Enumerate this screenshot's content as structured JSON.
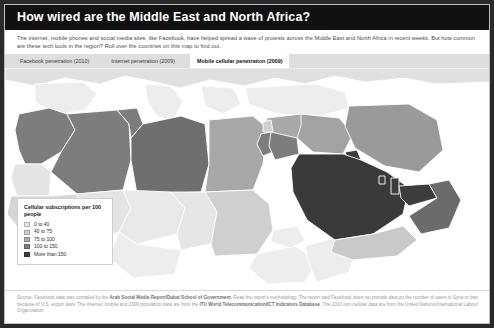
{
  "header": {
    "title": "How wired are the Middle East and North Africa?"
  },
  "deck": {
    "text": "The internet, mobile phones and social media sites, like Facebook, have helped spread a wave of protests across the Middle East and North Africa in recent weeks. But how common are these tech tools in the region? Roll over the countries on this map to find out."
  },
  "tabs": [
    {
      "label": "Facebook penetration (2010)",
      "active": false
    },
    {
      "label": "Internet penetration (2009)",
      "active": false
    },
    {
      "label": "Mobile cellular penetration (2009)",
      "active": true
    }
  ],
  "legend": {
    "title": "Cellular subscriptions per 100 people",
    "items": [
      {
        "label": "0 to 40",
        "color": "#e4e4e4"
      },
      {
        "label": "40 to 75",
        "color": "#cfcfcf"
      },
      {
        "label": "75 to 100",
        "color": "#ababab"
      },
      {
        "label": "100 to 150",
        "color": "#7d7d7d"
      },
      {
        "label": "More than 150",
        "color": "#3d3d3d"
      }
    ]
  },
  "footer": {
    "source_prefix": "Source: Facebook data was compiled by the ",
    "source_bold1": "Arab Social Media Report/Dubai School of Government",
    "source_mid": ". Read the report's methodology. The report said Facebook does not provide data on the number of users in Syria or Iran because of U.S. export laws. The internet, mobile and 2009 population data are from the ",
    "source_bold2": "ITU World Telecommunication/ICT Indicators Database",
    "source_suffix": ". The 2010 non-cellular data are from the United Nations/International Labour Organization."
  },
  "map": {
    "ocean_color": "#ffffff",
    "border_color": "#ffffff",
    "no_data_color": "#ededed",
    "countries": [
      {
        "name": "morocco",
        "bucket": 3,
        "color": "#7d7d7d"
      },
      {
        "name": "western-sahara",
        "bucket": 0,
        "color": "#e4e4e4"
      },
      {
        "name": "algeria",
        "bucket": 3,
        "color": "#7d7d7d"
      },
      {
        "name": "tunisia",
        "bucket": 3,
        "color": "#7d7d7d"
      },
      {
        "name": "libya",
        "bucket": 3,
        "color": "#6f6f6f"
      },
      {
        "name": "egypt",
        "bucket": 2,
        "color": "#a8a8a8"
      },
      {
        "name": "sudan",
        "bucket": 1,
        "color": "#cfcfcf"
      },
      {
        "name": "mauritania",
        "bucket": 1,
        "color": "#d6d6d6"
      },
      {
        "name": "mali",
        "bucket": 0,
        "color": "#e4e4e4"
      },
      {
        "name": "niger",
        "bucket": 0,
        "color": "#e9e9e9"
      },
      {
        "name": "chad",
        "bucket": 0,
        "color": "#e6e6e6"
      },
      {
        "name": "saudi-arabia",
        "bucket": 4,
        "color": "#3a3a3a"
      },
      {
        "name": "yemen",
        "bucket": 1,
        "color": "#c9c9c9"
      },
      {
        "name": "oman",
        "bucket": 3,
        "color": "#6b6b6b"
      },
      {
        "name": "uae",
        "bucket": 4,
        "color": "#3d3d3d"
      },
      {
        "name": "qatar",
        "bucket": 4,
        "color": "#3d3d3d"
      },
      {
        "name": "bahrain",
        "bucket": 4,
        "color": "#3d3d3d"
      },
      {
        "name": "kuwait",
        "bucket": 4,
        "color": "#3d3d3d"
      },
      {
        "name": "iraq",
        "bucket": 2,
        "color": "#a3a3a3"
      },
      {
        "name": "iran",
        "bucket": 2,
        "color": "#9a9a9a"
      },
      {
        "name": "jordan",
        "bucket": 3,
        "color": "#7d7d7d"
      },
      {
        "name": "syria",
        "bucket": 2,
        "color": "#a8a8a8"
      },
      {
        "name": "lebanon",
        "bucket": 1,
        "color": "#cfcfcf"
      },
      {
        "name": "israel",
        "bucket": 3,
        "color": "#7d7d7d"
      },
      {
        "name": "turkey",
        "bucket": 0,
        "color": "#ededed"
      },
      {
        "name": "ethiopia",
        "bucket": 0,
        "color": "#ededed"
      },
      {
        "name": "eritrea",
        "bucket": 0,
        "color": "#ededed"
      },
      {
        "name": "somalia",
        "bucket": 0,
        "color": "#ededed"
      },
      {
        "name": "europe",
        "bucket": 0,
        "color": "#e0e0e0"
      },
      {
        "name": "nigeria",
        "bucket": 0,
        "color": "#ededed"
      }
    ]
  }
}
